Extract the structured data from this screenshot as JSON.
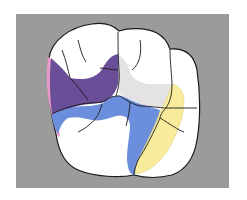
{
  "diagram": {
    "background_color": "#9b9b9b",
    "outline_color": "#1a1a1a",
    "regions": [
      {
        "id": "mesial-marginal",
        "color": "#e99ac8",
        "label": "pink strip"
      },
      {
        "id": "mesial-fossa",
        "color": "#6a4f98",
        "label": "purple region"
      },
      {
        "id": "central-groove",
        "color": "#6b8fdd",
        "label": "blue region"
      },
      {
        "id": "distal-fossa",
        "color": "#e4e2e4",
        "label": "light gray region"
      },
      {
        "id": "distal-marginal",
        "color": "#f8ec9c",
        "label": "yellow region"
      }
    ]
  }
}
